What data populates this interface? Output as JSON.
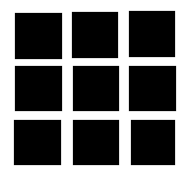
{
  "grid": {
    "rows": 3,
    "cols": 3,
    "color": "#000000",
    "background": "#ffffff",
    "squares": [
      {
        "x": 15,
        "y": 13,
        "w": 47,
        "h": 46
      },
      {
        "x": 72,
        "y": 12,
        "w": 46,
        "h": 46
      },
      {
        "x": 129,
        "y": 11,
        "w": 46,
        "h": 46
      },
      {
        "x": 15,
        "y": 66,
        "w": 47,
        "h": 45
      },
      {
        "x": 73,
        "y": 66,
        "w": 46,
        "h": 45
      },
      {
        "x": 129,
        "y": 66,
        "w": 47,
        "h": 45
      },
      {
        "x": 14,
        "y": 120,
        "w": 47,
        "h": 45
      },
      {
        "x": 73,
        "y": 120,
        "w": 46,
        "h": 45
      },
      {
        "x": 131,
        "y": 120,
        "w": 44,
        "h": 45
      }
    ]
  }
}
